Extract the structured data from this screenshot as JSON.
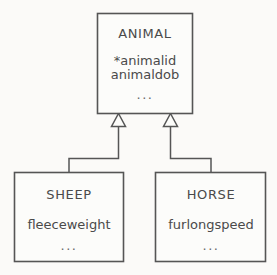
{
  "diagram": {
    "type": "uml-generalization",
    "background_color": "#fbfaf8",
    "stroke_color": "#555555",
    "text_color": "#4a4a4a",
    "superclass": {
      "name": "ANIMAL",
      "attributes": [
        "*animalid",
        "animaldob"
      ],
      "ellipsis": "..."
    },
    "subclasses": [
      {
        "name": "SHEEP",
        "attributes": [
          "fleeceweight"
        ],
        "ellipsis": "..."
      },
      {
        "name": "HORSE",
        "attributes": [
          "furlongspeed"
        ],
        "ellipsis": "..."
      }
    ],
    "relationships": [
      {
        "kind": "generalization",
        "from": "SHEEP",
        "to": "ANIMAL",
        "arrowhead": "hollow-triangle"
      },
      {
        "kind": "generalization",
        "from": "HORSE",
        "to": "ANIMAL",
        "arrowhead": "hollow-triangle"
      }
    ]
  }
}
